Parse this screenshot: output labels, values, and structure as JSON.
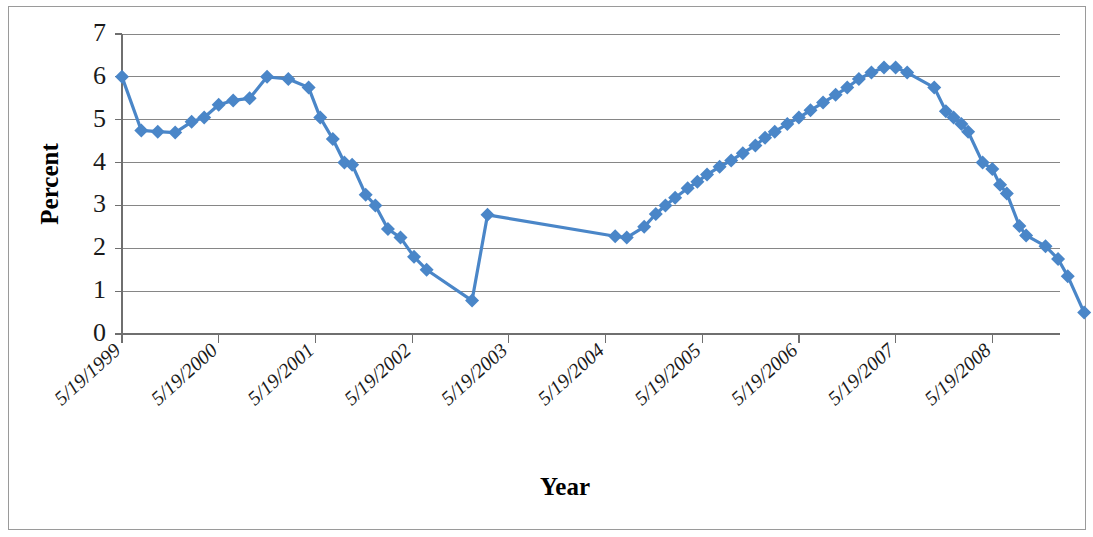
{
  "chart_data": {
    "type": "line",
    "title": "",
    "xlabel": "Year",
    "ylabel": "Percent",
    "ylim": [
      0,
      7
    ],
    "ytick_labels": [
      "0",
      "1",
      "2",
      "3",
      "4",
      "5",
      "6",
      "7"
    ],
    "yticks": [
      0,
      1,
      2,
      3,
      4,
      5,
      6,
      7
    ],
    "grid": true,
    "legend": "none",
    "xtick_labels": [
      "5/19/1999",
      "5/19/2000",
      "5/19/2001",
      "5/19/2002",
      "5/19/2003",
      "5/19/2004",
      "5/19/2005",
      "5/19/2006",
      "5/19/2007",
      "5/19/2008"
    ],
    "xtick_values": [
      1999.0,
      2000.0,
      2001.0,
      2002.0,
      2003.0,
      2004.0,
      2005.0,
      2006.0,
      2007.0,
      2008.0
    ],
    "xlim": [
      1999.0,
      2009.0
    ],
    "series_color": "#4a86c8",
    "marker": "diamond",
    "series": [
      {
        "name": "Percent",
        "points": [
          [
            1999.0,
            6.0
          ],
          [
            1999.2,
            4.75
          ],
          [
            1999.37,
            4.72
          ],
          [
            1999.55,
            4.7
          ],
          [
            1999.72,
            4.95
          ],
          [
            1999.85,
            5.05
          ],
          [
            2000.0,
            5.35
          ],
          [
            2000.15,
            5.45
          ],
          [
            2000.32,
            5.5
          ],
          [
            2000.5,
            6.0
          ],
          [
            2000.72,
            5.95
          ],
          [
            2000.93,
            5.75
          ],
          [
            2001.05,
            5.05
          ],
          [
            2001.18,
            4.55
          ],
          [
            2001.3,
            4.0
          ],
          [
            2001.38,
            3.95
          ],
          [
            2001.52,
            3.25
          ],
          [
            2001.62,
            3.0
          ],
          [
            2001.75,
            2.45
          ],
          [
            2001.88,
            2.25
          ],
          [
            2002.02,
            1.8
          ],
          [
            2002.15,
            1.5
          ],
          [
            2002.62,
            0.78
          ],
          [
            2002.78,
            2.78
          ],
          [
            2004.1,
            2.28
          ],
          [
            2004.22,
            2.25
          ],
          [
            2004.4,
            2.5
          ],
          [
            2004.52,
            2.8
          ],
          [
            2004.62,
            3.0
          ],
          [
            2004.72,
            3.18
          ],
          [
            2004.85,
            3.4
          ],
          [
            2004.95,
            3.55
          ],
          [
            2005.05,
            3.72
          ],
          [
            2005.18,
            3.9
          ],
          [
            2005.3,
            4.05
          ],
          [
            2005.42,
            4.22
          ],
          [
            2005.55,
            4.4
          ],
          [
            2005.65,
            4.58
          ],
          [
            2005.75,
            4.72
          ],
          [
            2005.88,
            4.9
          ],
          [
            2006.0,
            5.05
          ],
          [
            2006.12,
            5.22
          ],
          [
            2006.25,
            5.4
          ],
          [
            2006.38,
            5.58
          ],
          [
            2006.5,
            5.75
          ],
          [
            2006.62,
            5.95
          ],
          [
            2006.75,
            6.1
          ],
          [
            2006.88,
            6.22
          ],
          [
            2007.0,
            6.22
          ],
          [
            2007.12,
            6.1
          ],
          [
            2007.4,
            5.75
          ],
          [
            2007.52,
            5.2
          ],
          [
            2007.6,
            5.05
          ],
          [
            2007.68,
            4.9
          ],
          [
            2007.75,
            4.72
          ],
          [
            2007.9,
            4.0
          ],
          [
            2008.0,
            3.85
          ],
          [
            2008.08,
            3.48
          ],
          [
            2008.15,
            3.28
          ],
          [
            2008.28,
            2.52
          ],
          [
            2008.35,
            2.3
          ],
          [
            2008.55,
            2.05
          ],
          [
            2008.68,
            1.75
          ],
          [
            2008.78,
            1.35
          ],
          [
            2008.95,
            0.5
          ]
        ]
      }
    ]
  },
  "axes": {
    "y_title": "Percent",
    "x_title": "Year"
  }
}
